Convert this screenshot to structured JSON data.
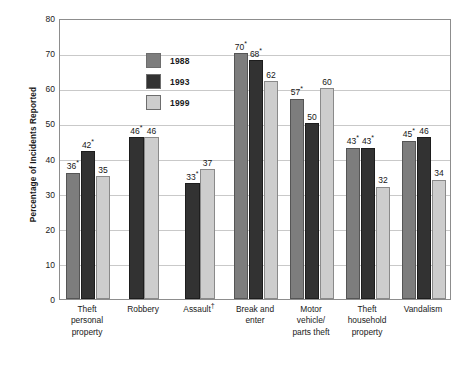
{
  "chart_data": {
    "type": "bar",
    "title": "",
    "xlabel": "",
    "ylabel": "Percentage of Incidents Reported",
    "ylim": [
      0,
      80
    ],
    "yticks": [
      0,
      10,
      20,
      30,
      40,
      50,
      60,
      70,
      80
    ],
    "grid": true,
    "legend_position": "inside-top-left",
    "categories": [
      "Theft personal property",
      "Robbery",
      "Assault†",
      "Break and enter",
      "Motor vehicle/ parts theft",
      "Theft household property",
      "Vandalism"
    ],
    "category_lines": [
      [
        "Theft",
        "personal",
        "property"
      ],
      [
        "Robbery"
      ],
      [
        "Assault†"
      ],
      [
        "Break and",
        "enter"
      ],
      [
        "Motor",
        "vehicle/",
        "parts theft"
      ],
      [
        "Theft",
        "household",
        "property"
      ],
      [
        "Vandalism"
      ]
    ],
    "series": [
      {
        "name": "1988",
        "color": "#7d7d7d",
        "values": [
          36,
          null,
          null,
          70,
          57,
          43,
          45
        ],
        "labels": [
          "36*",
          "",
          "",
          "70*",
          "57*",
          "43*",
          "45*"
        ]
      },
      {
        "name": "1993",
        "color": "#323232",
        "values": [
          42,
          46,
          33,
          68,
          50,
          43,
          46
        ],
        "labels": [
          "42*",
          "46*",
          "33*",
          "68*",
          "50",
          "43*",
          "46"
        ]
      },
      {
        "name": "1999",
        "color": "#cdcdcd",
        "values": [
          35,
          46,
          37,
          62,
          60,
          32,
          34
        ],
        "labels": [
          "35",
          "46",
          "37",
          "62",
          "60",
          "32",
          "34"
        ]
      }
    ]
  },
  "legend": {
    "items": [
      {
        "label": "1988",
        "swatch": "y1988"
      },
      {
        "label": "1993",
        "swatch": "y1993"
      },
      {
        "label": "1999",
        "swatch": "y1999"
      }
    ]
  }
}
